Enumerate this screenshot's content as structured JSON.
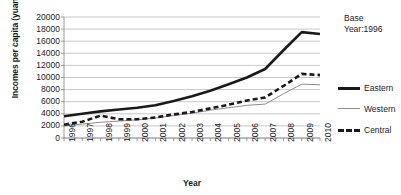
{
  "chart_data": {
    "type": "line",
    "title": "",
    "xlabel": "Year",
    "ylabel": "Incomes per capita (yuan)",
    "categories": [
      "1996",
      "1997",
      "1998",
      "1999",
      "2000",
      "2001",
      "2002",
      "2003",
      "2004",
      "2005",
      "2006",
      "2007",
      "2008",
      "2009",
      "2010"
    ],
    "x": [
      1996,
      1997,
      1998,
      1999,
      2000,
      2001,
      2002,
      2003,
      2004,
      2005,
      2006,
      2007,
      2008,
      2009,
      2010
    ],
    "ylim": [
      0,
      20000
    ],
    "ytick_values": [
      0,
      2000,
      4000,
      6000,
      8000,
      10000,
      12000,
      14000,
      16000,
      18000,
      20000
    ],
    "ytick_labels": [
      "0",
      "2000",
      "4000",
      "6000",
      "8000",
      "10000",
      "12000",
      "14000",
      "16000",
      "18000",
      "20000"
    ],
    "grid": true,
    "grid_axis": "y",
    "legend_position": "right",
    "annotations": [
      {
        "name": "base-year",
        "line1": "Base",
        "line2": "Year:1996"
      }
    ],
    "series": [
      {
        "name": "Eastern",
        "style": "solid",
        "width": 2.6,
        "color": "#1a1a1a",
        "values": [
          3600,
          4000,
          4400,
          4700,
          5000,
          5400,
          6100,
          6900,
          7800,
          8900,
          10000,
          11400,
          14500,
          17500,
          17200
        ]
      },
      {
        "name": "Western",
        "style": "solid",
        "width": 1,
        "color": "#8c8c8c",
        "values": [
          2000,
          2300,
          2600,
          2800,
          3000,
          3300,
          3700,
          4100,
          4600,
          5000,
          5400,
          5600,
          7300,
          8900,
          8800
        ]
      },
      {
        "name": "Central",
        "style": "dashed",
        "width": 2.6,
        "color": "#1a1a1a",
        "values": [
          2200,
          2700,
          3700,
          3100,
          3100,
          3400,
          3900,
          4300,
          4900,
          5500,
          6200,
          6700,
          8600,
          10600,
          10400
        ]
      }
    ]
  },
  "axis": {
    "ylabel": "Incomes per capita (yuan)",
    "xlabel": "Year"
  },
  "legend": {
    "items": [
      {
        "label": "Eastern"
      },
      {
        "label": "Western"
      },
      {
        "label": "Central"
      }
    ]
  },
  "annotation": {
    "base": "Base",
    "year": "Year:1996"
  },
  "colors": {
    "eastern": "#1a1a1a",
    "western": "#8c8c8c",
    "central": "#1a1a1a",
    "grid": "#b0b0b0",
    "axis": "#8c8c8c",
    "text": "#1a1a1a",
    "background": "#ffffff"
  }
}
